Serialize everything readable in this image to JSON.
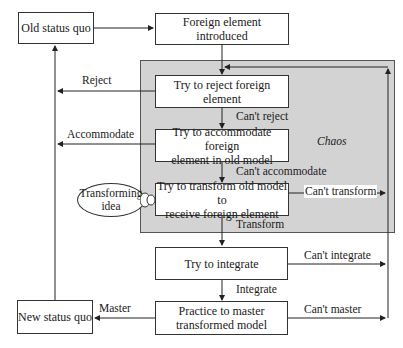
{
  "diagram": {
    "type": "flowchart",
    "region": {
      "label": "Chaos",
      "fill": "#d3d3d3"
    },
    "nodes": {
      "old_status_quo": "Old status quo",
      "foreign_element": "Foreign element introduced",
      "try_reject": "Try to reject foreign element",
      "try_accommodate_1": "Try to accommodate foreign",
      "try_accommodate_2": "element in old model",
      "try_transform_1": "Try to transform old model to",
      "try_transform_2": "receive foreign element",
      "transforming_idea_1": "Transforming",
      "transforming_idea_2": "idea",
      "try_integrate": "Try to integrate",
      "practice_master_1": "Practice to master",
      "practice_master_2": "transformed model",
      "new_status_quo": "New status quo"
    },
    "edges": {
      "reject": "Reject",
      "cant_reject": "Can't reject",
      "accommodate": "Accommodate",
      "cant_accommodate": "Can't accommodate",
      "cant_transform": "Can't transform",
      "transform": "Transform",
      "cant_integrate": "Can't integrate",
      "integrate": "Integrate",
      "master": "Master",
      "cant_master": "Can't master"
    }
  }
}
